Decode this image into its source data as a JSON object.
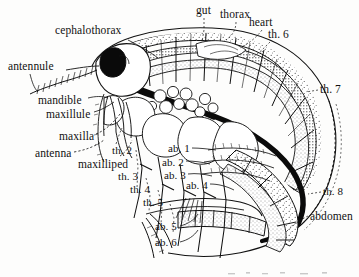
{
  "figure": {
    "background_color": "#fdfdfc",
    "ink_color": "#111111"
  },
  "labels": [
    {
      "id": "cephalothorax",
      "text": "cephalothorax",
      "x": 55,
      "y": 25
    },
    {
      "id": "gut",
      "text": "gut",
      "x": 196,
      "y": 5
    },
    {
      "id": "thorax",
      "text": "thorax",
      "x": 220,
      "y": 9
    },
    {
      "id": "heart",
      "text": "heart",
      "x": 249,
      "y": 17
    },
    {
      "id": "th6",
      "text": "th. 6",
      "x": 268,
      "y": 29
    },
    {
      "id": "th7",
      "text": "th. 7",
      "x": 320,
      "y": 84
    },
    {
      "id": "antennule",
      "text": "antennule",
      "x": 8,
      "y": 61
    },
    {
      "id": "mandible",
      "text": "mandible",
      "x": 38,
      "y": 95
    },
    {
      "id": "maxillule",
      "text": "maxillule",
      "x": 46,
      "y": 109
    },
    {
      "id": "maxilla",
      "text": "maxilla",
      "x": 59,
      "y": 131
    },
    {
      "id": "antenna",
      "text": "antenna",
      "x": 35,
      "y": 148
    },
    {
      "id": "maxilliped",
      "text": "maxilliped",
      "x": 78,
      "y": 159
    },
    {
      "id": "th2",
      "text": "th. 2",
      "x": 112,
      "y": 145
    },
    {
      "id": "th3",
      "text": "th. 3",
      "x": 118,
      "y": 171
    },
    {
      "id": "th4",
      "text": "th. 4",
      "x": 130,
      "y": 184
    },
    {
      "id": "th5",
      "text": "th. 5",
      "x": 143,
      "y": 197
    },
    {
      "id": "ab1",
      "text": "ab. 1",
      "x": 168,
      "y": 143
    },
    {
      "id": "ab2",
      "text": "ab. 2",
      "x": 162,
      "y": 157
    },
    {
      "id": "ab3",
      "text": "ab. 3",
      "x": 164,
      "y": 170
    },
    {
      "id": "ab4",
      "text": "ab. 4",
      "x": 186,
      "y": 180
    },
    {
      "id": "ab5",
      "text": "ab. 5",
      "x": 155,
      "y": 221
    },
    {
      "id": "ab6",
      "text": "ab. 6",
      "x": 155,
      "y": 237
    },
    {
      "id": "th8",
      "text": "th. 8",
      "x": 323,
      "y": 186
    },
    {
      "id": "abdomen",
      "text": "abdomen",
      "x": 310,
      "y": 211
    }
  ]
}
